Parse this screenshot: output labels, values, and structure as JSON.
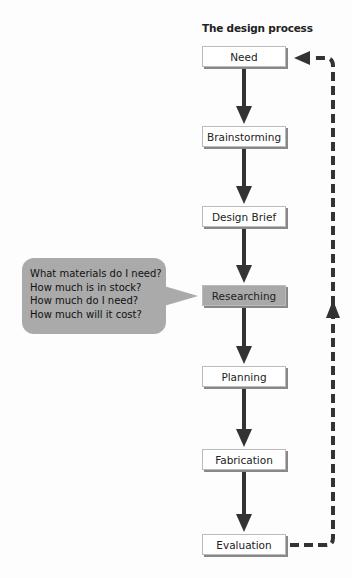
{
  "diagram": {
    "title": "The design process",
    "steps": [
      {
        "label": "Need",
        "y": 46
      },
      {
        "label": "Brainstorming",
        "y": 126
      },
      {
        "label": "Design Brief",
        "y": 206
      },
      {
        "label": "Researching",
        "y": 285,
        "highlighted": true
      },
      {
        "label": "Planning",
        "y": 366
      },
      {
        "label": "Fabrication",
        "y": 449
      },
      {
        "label": "Evaluation",
        "y": 534
      }
    ],
    "callout": {
      "target": "Researching",
      "lines": [
        "What materials do I need?",
        "How much is in stock?",
        "How much do I need?",
        "How much will it cost?"
      ]
    },
    "feedback_loop": {
      "from": "Evaluation",
      "to": "Need",
      "style": "dashed"
    },
    "colors": {
      "arrow": "#333333",
      "box_border": "#bbbbbb",
      "highlight": "#a9a9a9",
      "bubble": "#aaaaaa"
    }
  }
}
